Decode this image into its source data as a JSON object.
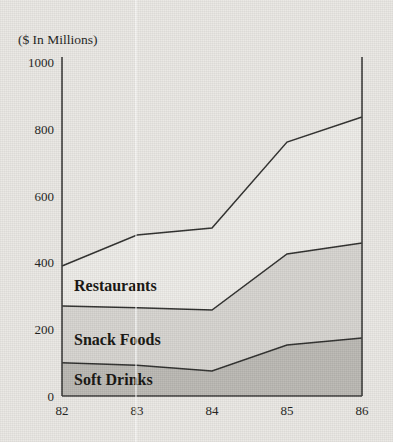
{
  "chart_data": {
    "type": "area",
    "title": "",
    "subtitle": "",
    "axis_title": "($ In Millions)",
    "xlabel": "",
    "ylabel": "($ In Millions)",
    "categories": [
      "82",
      "83",
      "84",
      "85",
      "86"
    ],
    "x": [
      82,
      83,
      84,
      85,
      86
    ],
    "xlim": [
      82,
      86
    ],
    "ylim": [
      0,
      1000
    ],
    "yticks": [
      0,
      200,
      400,
      600,
      800,
      1000
    ],
    "ytick_labels": [
      "0",
      "200",
      "400",
      "600",
      "800",
      "1000"
    ],
    "xtick_labels": [
      "82",
      "83",
      "84",
      "85",
      "86"
    ],
    "grid": false,
    "legend_position": "inline-band-labels",
    "stacked": true,
    "series": [
      {
        "name": "Soft Drinks",
        "values": [
          100,
          92,
          75,
          153,
          174
        ],
        "cumulative": [
          100,
          92,
          75,
          153,
          174
        ],
        "fill_color": "#bab8b3"
      },
      {
        "name": "Snack Foods",
        "values": [
          170,
          173,
          183,
          273,
          285
        ],
        "cumulative": [
          270,
          265,
          258,
          426,
          459
        ],
        "fill_color": "#d6d4d0"
      },
      {
        "name": "Restaurants",
        "values": [
          120,
          218,
          246,
          336,
          378
        ],
        "cumulative": [
          390,
          483,
          504,
          762,
          837
        ],
        "fill_color": "#edebe7"
      }
    ],
    "band_labels": [
      {
        "text": "Restaurants",
        "x": 74,
        "y": 291
      },
      {
        "text": "Snack Foods",
        "x": 74,
        "y": 345
      },
      {
        "text": "Soft Drinks",
        "x": 74,
        "y": 385
      }
    ],
    "colors": {
      "background": "#e9e7e3",
      "axis": "#3a3a38",
      "line": "#2e2e2c",
      "text": "#1d1d1b"
    },
    "geometry": {
      "plot_left": 62,
      "plot_right": 362,
      "plot_top": 57,
      "plot_bottom": 396
    }
  }
}
